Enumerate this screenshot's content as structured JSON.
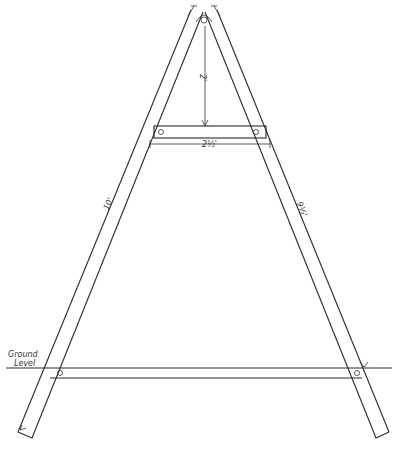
{
  "diagram": {
    "type": "a-frame technical drawing",
    "labels": {
      "left_leg_length": "10'",
      "right_leg_length": "9½'",
      "top_drop": "2'",
      "crossbar_width": "2½'",
      "ground_label_line1": "Ground",
      "ground_label_line2": "Level"
    },
    "colors": {
      "ink": "#2a2a2a",
      "paper": "#ffffff"
    }
  }
}
